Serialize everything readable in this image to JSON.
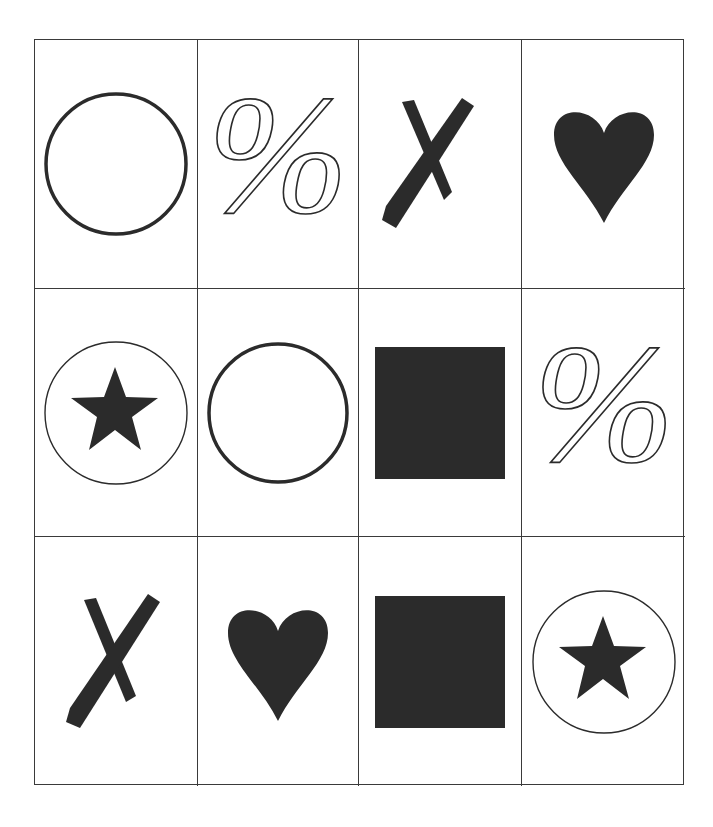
{
  "grid": {
    "rows": 3,
    "columns": 4,
    "cells": [
      {
        "row": 1,
        "col": 1,
        "symbol": "circle-outline",
        "label": "Circle"
      },
      {
        "row": 1,
        "col": 2,
        "symbol": "percent-outline",
        "label": "Percent"
      },
      {
        "row": 1,
        "col": 3,
        "symbol": "x-brush",
        "label": "X"
      },
      {
        "row": 1,
        "col": 4,
        "symbol": "heart-filled",
        "label": "Heart"
      },
      {
        "row": 2,
        "col": 1,
        "symbol": "star-in-circle",
        "label": "Star in circle"
      },
      {
        "row": 2,
        "col": 2,
        "symbol": "circle-outline",
        "label": "Circle"
      },
      {
        "row": 2,
        "col": 3,
        "symbol": "square-filled",
        "label": "Square"
      },
      {
        "row": 2,
        "col": 4,
        "symbol": "percent-outline",
        "label": "Percent"
      },
      {
        "row": 3,
        "col": 1,
        "symbol": "x-brush",
        "label": "X"
      },
      {
        "row": 3,
        "col": 2,
        "symbol": "heart-filled",
        "label": "Heart"
      },
      {
        "row": 3,
        "col": 3,
        "symbol": "square-filled",
        "label": "Square"
      },
      {
        "row": 3,
        "col": 4,
        "symbol": "star-in-circle",
        "label": "Star in circle"
      }
    ]
  },
  "colors": {
    "ink": "#2b2b2b",
    "line": "#3a3a3a",
    "background": "#ffffff"
  }
}
